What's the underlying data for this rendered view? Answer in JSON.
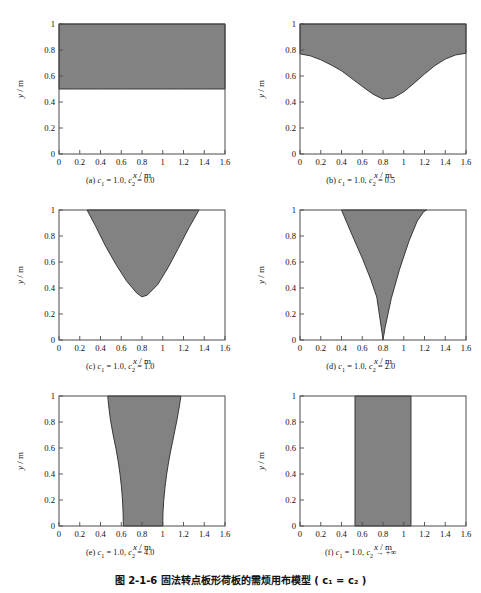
{
  "page": {
    "header_ghost": "",
    "figure_caption_number": "图 2-1-6",
    "figure_caption_text": "固法转点板形荷板的需烦用布模型 ( c₁ = c₂ )"
  },
  "axes": {
    "xlabel_symbol": "x",
    "xlabel_unit": "/ m",
    "ylabel_symbol": "y",
    "ylabel_unit": "/ m",
    "xticks": [
      "0",
      "0.2",
      "0.4",
      "0.6",
      "0.8",
      "1",
      "1.2",
      "1.4",
      "1.6"
    ],
    "xtickvals": [
      0,
      0.2,
      0.4,
      0.6,
      0.8,
      1.0,
      1.2,
      1.4,
      1.6
    ],
    "yticks": [
      "0",
      "0.2",
      "0.4",
      "0.6",
      "0.8",
      "1"
    ],
    "ytickvals": [
      0,
      0.2,
      0.4,
      0.6,
      0.8,
      1.0
    ],
    "xlim": [
      0,
      1.6
    ],
    "ylim": [
      0,
      1.0
    ]
  },
  "colors": {
    "region_fill": "#828282",
    "region_stroke": "#2a2a2a",
    "axis": "#4a4a4a",
    "background": "#ffffff",
    "text": "#111111"
  },
  "chart_data": [
    {
      "id": "a",
      "type": "area",
      "title": "(a) c1 = 1.0, c2 = 0.0",
      "caption_parts": {
        "label": "(a)",
        "c1_name": "c",
        "c1_sub": "1",
        "c1_value": "1.0",
        "c2_name": "c",
        "c2_sub": "2",
        "c2_value": "0.0"
      },
      "xlabel": "x / m",
      "ylabel": "y / m",
      "xlim": [
        0,
        1.6
      ],
      "ylim": [
        0,
        1.0
      ],
      "grid": false,
      "description": "Uniform horizontal band: shaded region above the flat line y = 0.50 across the full width.",
      "boundary_x": [
        0.0,
        0.2,
        0.4,
        0.6,
        0.8,
        1.0,
        1.2,
        1.4,
        1.6
      ],
      "boundary_y": [
        0.5,
        0.5,
        0.5,
        0.5,
        0.5,
        0.5,
        0.5,
        0.5,
        0.5
      ],
      "fill_above": true
    },
    {
      "id": "b",
      "type": "area",
      "title": "(b) c1 = 1.0, c2 = 0.5",
      "caption_parts": {
        "label": "(b)",
        "c1_name": "c",
        "c1_sub": "1",
        "c1_value": "1.0",
        "c2_name": "c",
        "c2_sub": "2",
        "c2_value": "0.5"
      },
      "xlabel": "x / m",
      "ylabel": "y / m",
      "xlim": [
        0,
        1.6
      ],
      "ylim": [
        0,
        1.0
      ],
      "grid": false,
      "description": "Smooth cosine-like trough: boundary starts at y = 0.77 on both edges and dips to a minimum of y = 0.42 near x = 0.80; shading above the curve.",
      "boundary_x": [
        0.0,
        0.1,
        0.2,
        0.3,
        0.4,
        0.5,
        0.6,
        0.7,
        0.8,
        0.9,
        1.0,
        1.1,
        1.2,
        1.3,
        1.4,
        1.5,
        1.6
      ],
      "boundary_y": [
        0.77,
        0.755,
        0.725,
        0.685,
        0.64,
        0.58,
        0.52,
        0.462,
        0.422,
        0.432,
        0.478,
        0.545,
        0.615,
        0.68,
        0.73,
        0.762,
        0.775
      ],
      "fill_above": true
    },
    {
      "id": "c",
      "type": "area",
      "title": "(c) c1 = 1.0, c2 = 1.0",
      "caption_parts": {
        "label": "(c)",
        "c1_name": "c",
        "c1_sub": "1",
        "c1_value": "1.0",
        "c2_name": "c",
        "c2_sub": "2",
        "c2_value": "1.0"
      },
      "xlabel": "x / m",
      "ylabel": "y / m",
      "xlim": [
        0,
        1.6
      ],
      "ylim": [
        0,
        1.0
      ],
      "grid": false,
      "description": "Parabolic trough fully inside the frame: boundary meets the top edge (y = 1) at x = 0.27 and x = 1.35, with minimum y = 0.33 at x = 0.80.",
      "boundary_x": [
        0.27,
        0.35,
        0.45,
        0.55,
        0.65,
        0.75,
        0.8,
        0.85,
        0.95,
        1.05,
        1.15,
        1.25,
        1.35
      ],
      "boundary_y": [
        1.0,
        0.88,
        0.72,
        0.58,
        0.455,
        0.36,
        0.332,
        0.345,
        0.425,
        0.555,
        0.705,
        0.86,
        1.0
      ],
      "fill_above": true
    },
    {
      "id": "d",
      "type": "area",
      "title": "(d) c1 = 1.0, c2 = 2.0",
      "caption_parts": {
        "label": "(d)",
        "c1_name": "c",
        "c1_sub": "1",
        "c1_value": "1.0",
        "c2_name": "c",
        "c2_sub": "2",
        "c2_value": "2.0"
      },
      "xlabel": "x / m",
      "ylabel": "y / m",
      "xlim": [
        0,
        1.6
      ],
      "ylim": [
        0,
        1.0
      ],
      "grid": false,
      "description": "Narrow V / cusp shape touching the bottom axis at x = 0.80, widening to span x = 0.40 to x = 1.22 at the top edge y = 1.",
      "boundary_x": [
        0.4,
        0.45,
        0.52,
        0.6,
        0.68,
        0.74,
        0.79,
        0.8,
        0.82,
        0.88,
        0.96,
        1.05,
        1.13,
        1.19,
        1.22
      ],
      "boundary_y": [
        1.0,
        0.905,
        0.775,
        0.63,
        0.47,
        0.33,
        0.06,
        0.0,
        0.095,
        0.32,
        0.545,
        0.76,
        0.915,
        0.985,
        1.0
      ],
      "fill_above": true
    },
    {
      "id": "e",
      "type": "area",
      "title": "(e) c1 = 1.0, c2 = 4.0",
      "caption_parts": {
        "label": "(e)",
        "c1_name": "c",
        "c1_sub": "1",
        "c1_value": "1.0",
        "c2_name": "c",
        "c2_sub": "2",
        "c2_value": "4.0"
      },
      "xlabel": "x / m",
      "ylabel": "y / m",
      "xlim": [
        0,
        1.6
      ],
      "ylim": [
        0,
        1.0
      ],
      "grid": false,
      "description": "Vertical flared band: at the bottom (y = 0) it spans x = 0.62 to x = 1.00; at the top (y = 1) it spans x = 0.47 to x = 1.17.",
      "left_x": [
        0.62,
        0.618,
        0.612,
        0.602,
        0.588,
        0.57,
        0.548,
        0.522,
        0.495,
        0.478,
        0.47
      ],
      "left_y": [
        0.0,
        0.1,
        0.2,
        0.3,
        0.4,
        0.5,
        0.6,
        0.7,
        0.82,
        0.93,
        1.0
      ],
      "right_x": [
        1.0,
        1.002,
        1.01,
        1.022,
        1.038,
        1.058,
        1.082,
        1.108,
        1.138,
        1.162,
        1.175
      ],
      "right_y": [
        0.0,
        0.1,
        0.2,
        0.3,
        0.4,
        0.5,
        0.6,
        0.7,
        0.82,
        0.93,
        1.0
      ]
    },
    {
      "id": "f",
      "type": "area",
      "title": "(f) c1 = 1.0, c2 -> +inf",
      "caption_parts": {
        "label": "(f)",
        "c1_name": "c",
        "c1_sub": "1",
        "c1_value": "1.0",
        "c2_name": "c",
        "c2_sub": "2",
        "c2_value": "+∞",
        "arrow": "→"
      },
      "xlabel": "x / m",
      "ylabel": "y / m",
      "xlim": [
        0,
        1.6
      ],
      "ylim": [
        0,
        1.0
      ],
      "grid": false,
      "description": "Limiting case: a straight vertical rectangle of constant width spanning x = 0.53 to x = 1.07 over the full height y = 0 to y = 1.",
      "left_x": [
        0.53,
        0.53
      ],
      "left_y": [
        0.0,
        1.0
      ],
      "right_x": [
        1.07,
        1.07
      ],
      "right_y": [
        0.0,
        1.0
      ]
    }
  ]
}
